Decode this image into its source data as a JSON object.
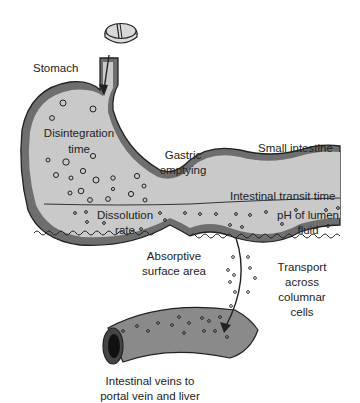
{
  "diagram": {
    "colors": {
      "lumen": "#c9c9c9",
      "wall": "#6e6e6e",
      "outline": "#222222",
      "vein": "#8a8a8a",
      "background": "#ffffff"
    },
    "labels": {
      "stomach": "Stomach",
      "disintegration_line1": "Disintegration",
      "disintegration_line2": "time",
      "gastric_line1": "Gastric",
      "gastric_line2": "emptying",
      "small_intestine": "Small intestine",
      "transit_time": "Intestinal transit time",
      "dissolution_line1": "Dissolution",
      "dissolution_line2": "rate",
      "ph_line1": "pH of lumen",
      "ph_line2": "fluid",
      "absorptive_line1": "Absorptive",
      "absorptive_line2": "surface area",
      "transport_line1": "Transport",
      "transport_line2": "across",
      "transport_line3": "columnar",
      "transport_line4": "cells",
      "veins_line1": "Intestinal veins to",
      "veins_line2": "portal vein and liver"
    },
    "icons": [
      "tablet-icon",
      "stomach-shape",
      "small-intestine-shape",
      "intestinal-vein-shape",
      "absorption-arrow-icon"
    ]
  }
}
